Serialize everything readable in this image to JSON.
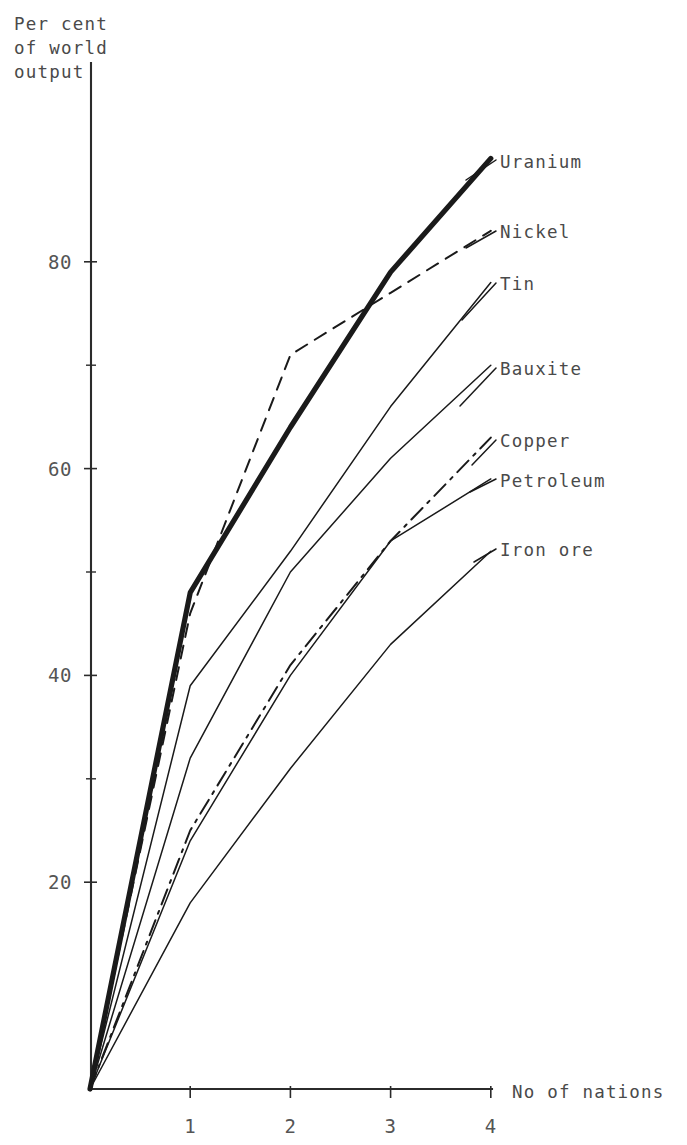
{
  "chart_data": {
    "type": "line",
    "title": "",
    "subtitle": "",
    "xlabel": "No of nations",
    "ylabel": "Per cent of world output",
    "ylabel_lines": [
      "Per cent",
      "of world",
      "output"
    ],
    "x": [
      0,
      1,
      2,
      3,
      4
    ],
    "xlim": [
      0,
      4.0
    ],
    "ylim": [
      0,
      93
    ],
    "xticks": [
      1,
      2,
      3,
      4
    ],
    "xticklabels": [
      "1",
      "2",
      "3",
      "4"
    ],
    "yticks": [
      20,
      40,
      60,
      80
    ],
    "yticklabels": [
      "20",
      "40",
      "60",
      "80"
    ],
    "yticks_minor": [
      30,
      50,
      70
    ],
    "grid": false,
    "legend_position": "right-inline-labels",
    "series": [
      {
        "name": "Uranium",
        "values": [
          0,
          48,
          64,
          79,
          90
        ],
        "style": "solid",
        "linewidth": "thick",
        "color": "#1a1a1a",
        "label_x": 500,
        "label_y": 168
      },
      {
        "name": "Nickel",
        "values": [
          0,
          46,
          71,
          77,
          83
        ],
        "style": "dashed",
        "linewidth": "med",
        "color": "#1a1a1a",
        "label_x": 500,
        "label_y": 238
      },
      {
        "name": "Tin",
        "values": [
          0,
          39,
          52,
          66,
          78
        ],
        "style": "solid",
        "linewidth": "thin",
        "color": "#1a1a1a",
        "label_x": 500,
        "label_y": 290
      },
      {
        "name": "Bauxite",
        "values": [
          0,
          32,
          50,
          61,
          70
        ],
        "style": "solid",
        "linewidth": "thin",
        "color": "#1a1a1a",
        "label_x": 500,
        "label_y": 375
      },
      {
        "name": "Copper",
        "values": [
          0,
          25,
          41,
          53,
          63
        ],
        "style": "dashdot",
        "linewidth": "med",
        "color": "#1a1a1a",
        "label_x": 500,
        "label_y": 447
      },
      {
        "name": "Petroleum",
        "values": [
          0,
          24,
          40,
          53,
          59
        ],
        "style": "solid",
        "linewidth": "thin",
        "color": "#1a1a1a",
        "label_x": 500,
        "label_y": 487
      },
      {
        "name": "Iron ore",
        "values": [
          0,
          18,
          31,
          43,
          52
        ],
        "style": "solid",
        "linewidth": "thin",
        "color": "#1a1a1a",
        "label_x": 500,
        "label_y": 556
      }
    ],
    "leader_lines": [
      {
        "name": "Uranium",
        "x1": 466,
        "y1": 180,
        "x2": 496,
        "y2": 160
      },
      {
        "name": "Nickel",
        "x1": 466,
        "y1": 248,
        "x2": 496,
        "y2": 231
      },
      {
        "name": "Tin",
        "x1": 462,
        "y1": 320,
        "x2": 496,
        "y2": 283
      },
      {
        "name": "Bauxite",
        "x1": 460,
        "y1": 406,
        "x2": 496,
        "y2": 368
      },
      {
        "name": "Copper",
        "x1": 472,
        "y1": 465,
        "x2": 496,
        "y2": 440
      },
      {
        "name": "Petroleum",
        "x1": 470,
        "y1": 492,
        "x2": 496,
        "y2": 479
      },
      {
        "name": "Iron ore",
        "x1": 474,
        "y1": 562,
        "x2": 496,
        "y2": 549
      }
    ]
  },
  "axes": {
    "y_title_lines": [
      "Per cent",
      "of world",
      "output"
    ],
    "x_title": "No of nations"
  }
}
